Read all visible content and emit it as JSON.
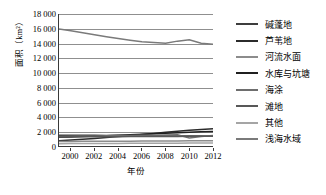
{
  "chart_data": {
    "type": "line",
    "title": "",
    "xlabel": "年份",
    "ylabel": "面积（km²）",
    "x": [
      1999,
      2000,
      2001,
      2002,
      2003,
      2004,
      2005,
      2006,
      2007,
      2008,
      2009,
      2010,
      2011,
      2012
    ],
    "xlim": [
      1999,
      2012
    ],
    "ylim": [
      0,
      18000
    ],
    "yticks": [
      0,
      2000,
      4000,
      6000,
      8000,
      10000,
      12000,
      14000,
      16000,
      18000
    ],
    "ytick_labels": [
      "0",
      "2 000",
      "4 000",
      "6 000",
      "8 000",
      "10 000",
      "12 000",
      "14 000",
      "16 000",
      "18 000"
    ],
    "xticks": [
      2000,
      2002,
      2004,
      2006,
      2008,
      2010,
      2012
    ],
    "xtick_labels": [
      "2000",
      "2002",
      "2004",
      "2006",
      "2008",
      "2010",
      "2012"
    ],
    "grid": "horizontal",
    "legend_position": "right",
    "series": [
      {
        "name": "碱蓬地",
        "color": "#3d3d3d",
        "values": [
          1480,
          1470,
          1460,
          1450,
          1440,
          1430,
          1420,
          1400,
          1390,
          1380,
          1370,
          1360,
          1350,
          1345
        ]
      },
      {
        "name": "芦苇地",
        "color": "#2b2b2b",
        "values": [
          700,
          810,
          920,
          1030,
          1150,
          1280,
          1400,
          1560,
          1720,
          1880,
          2020,
          2150,
          2260,
          2340
        ]
      },
      {
        "name": "河流水面",
        "color": "#8c8c8c",
        "values": [
          620,
          630,
          640,
          650,
          655,
          660,
          665,
          670,
          675,
          680,
          690,
          700,
          705,
          710
        ]
      },
      {
        "name": "水库与坑塘",
        "color": "#1f1f1f",
        "values": [
          1180,
          1230,
          1290,
          1350,
          1410,
          1470,
          1530,
          1600,
          1680,
          1750,
          1820,
          1880,
          1930,
          1975
        ]
      },
      {
        "name": "海涂",
        "color": "#6e6e6e",
        "values": [
          1310,
          1330,
          1350,
          1375,
          1400,
          1420,
          1440,
          1460,
          1480,
          1500,
          1520,
          1100,
          1300,
          1420
        ]
      },
      {
        "name": "滩地",
        "color": "#585858",
        "values": [
          1240,
          1250,
          1255,
          1260,
          1270,
          1275,
          1280,
          1290,
          1300,
          1305,
          1310,
          1315,
          1320,
          1325
        ]
      },
      {
        "name": "其他",
        "color": "#a5a5a5",
        "values": [
          320,
          330,
          335,
          340,
          350,
          355,
          360,
          370,
          375,
          380,
          390,
          395,
          400,
          405
        ]
      },
      {
        "name": "浅海水域",
        "color": "#7a7a7a",
        "values": [
          15950,
          15700,
          15450,
          15180,
          14900,
          14650,
          14420,
          14220,
          14100,
          14000,
          14300,
          14480,
          14020,
          13880
        ]
      }
    ]
  }
}
